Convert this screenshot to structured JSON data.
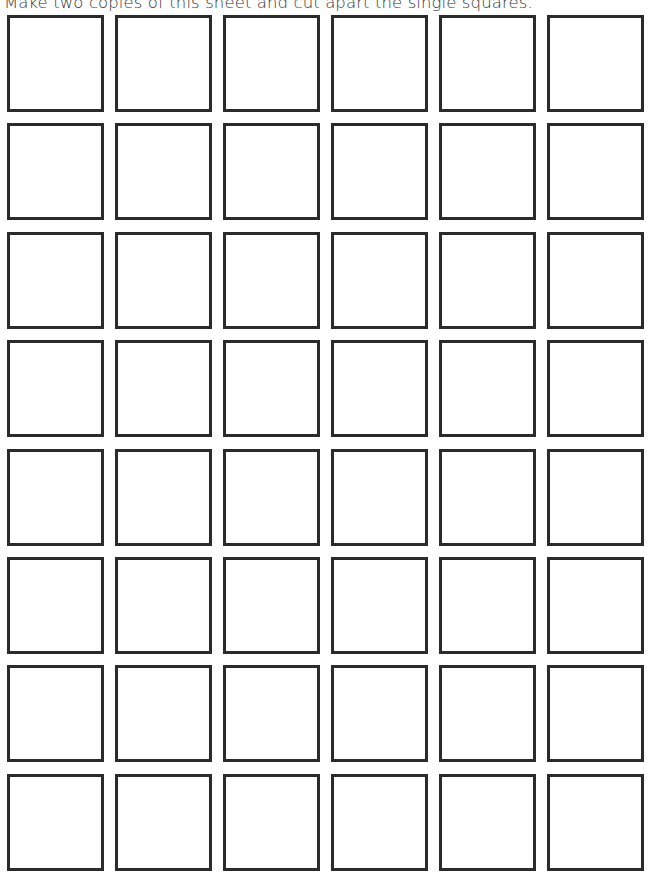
{
  "instruction": "Make two copies of this sheet and cut apart the single squares.",
  "grid": {
    "rows": 8,
    "columns": 6,
    "square_count": 48,
    "border_color": "#2b2b2b"
  }
}
